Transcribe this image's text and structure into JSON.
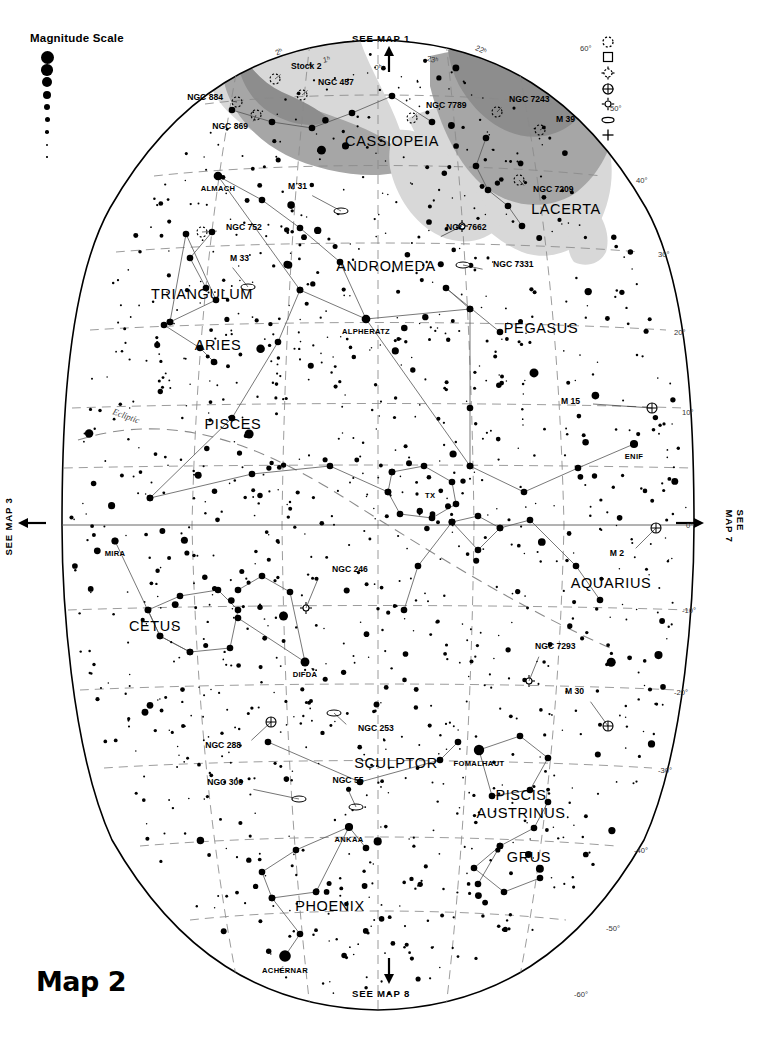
{
  "map": {
    "title": "Map 2",
    "navigation": {
      "top": "SEE MAP 1",
      "bottom": "SEE MAP 8",
      "left": "SEE MAP 3",
      "right": "SEE MAP 7"
    }
  },
  "magnitude_scale": {
    "title": "Magnitude Scale",
    "entries": [
      {
        "label": "-2",
        "size": 13
      },
      {
        "label": "-1",
        "size": 11.5
      },
      {
        "label": "0",
        "size": 10
      },
      {
        "label": "1",
        "size": 8.2
      },
      {
        "label": "2",
        "size": 6.4
      },
      {
        "label": "3",
        "size": 5.0
      },
      {
        "label": "4",
        "size": 3.6
      },
      {
        "label": "5",
        "size": 2.4
      },
      {
        "label": "6",
        "size": 1.6
      }
    ]
  },
  "object_legend": {
    "entries": [
      {
        "icon": "open-cluster-icon",
        "label": "Open Cluster"
      },
      {
        "icon": "bright-nebula-icon",
        "label": "Bright Nebula"
      },
      {
        "icon": "cluster-with-neb-icon",
        "label": "Cluster with Neb."
      },
      {
        "icon": "globular-cluster-icon",
        "label": "Globular Cluster"
      },
      {
        "icon": "planetary-nebula-icon",
        "label": "Planetary Nebula"
      },
      {
        "icon": "galaxy-icon",
        "label": "Galaxy"
      },
      {
        "icon": "extragalactic-object-icon",
        "label": "Object in other Galaxy"
      }
    ]
  },
  "chart_data": {
    "type": "scatter",
    "title": "Map 2",
    "projection": "elliptical sky chart",
    "ra_range_hours": [
      22,
      2
    ],
    "dec_range_deg": [
      -60,
      60
    ],
    "grid": true,
    "ra_ticks": [
      "2ʰ",
      "1ʰ",
      "0ʰ",
      "23ʰ",
      "22ʰ"
    ],
    "dec_ticks_right": [
      "60°",
      "50°",
      "40°",
      "30°",
      "20°",
      "10°",
      "0°",
      "-10°",
      "-20°",
      "-30°",
      "-40°",
      "-50°",
      "-60°"
    ],
    "ecliptic_label": "Ecliptic",
    "milky_way_shading": [
      "#d8d8d8",
      "#a6a6a6",
      "#8d8d8d"
    ],
    "constellations": [
      {
        "name": "CASSIOPEIA",
        "x": 392,
        "y": 146
      },
      {
        "name": "LACERTA",
        "x": 566,
        "y": 214
      },
      {
        "name": "ANDROMEDA",
        "x": 386,
        "y": 271
      },
      {
        "name": "TRIANGULUM",
        "x": 202,
        "y": 299
      },
      {
        "name": "ARIES",
        "x": 218,
        "y": 350
      },
      {
        "name": "PEGASUS",
        "x": 541,
        "y": 333
      },
      {
        "name": "PISCES",
        "x": 233,
        "y": 429
      },
      {
        "name": "AQUARIUS",
        "x": 611,
        "y": 588
      },
      {
        "name": "CETUS",
        "x": 155,
        "y": 631
      },
      {
        "name": "SCULPTOR",
        "x": 396,
        "y": 768
      },
      {
        "name": "PISCIS AUSTRINUS",
        "x": 521,
        "y": 800
      },
      {
        "name": "GRUS",
        "x": 529,
        "y": 862
      },
      {
        "name": "PHOENIX",
        "x": 330,
        "y": 911
      }
    ],
    "named_stars": [
      {
        "name": "ALMACH",
        "x": 218,
        "y": 176,
        "mag": 2.1
      },
      {
        "name": "ALPHERATZ",
        "x": 366,
        "y": 319,
        "mag": 2.1
      },
      {
        "name": "ENIF",
        "x": 634,
        "y": 444,
        "mag": 2.4
      },
      {
        "name": "MIRA",
        "x": 115,
        "y": 541,
        "mag": 3.0
      },
      {
        "name": "DIFDA",
        "x": 305,
        "y": 662,
        "mag": 2.0
      },
      {
        "name": "FOMALHAUT",
        "x": 479,
        "y": 750,
        "mag": 1.2
      },
      {
        "name": "ANKAA",
        "x": 349,
        "y": 827,
        "mag": 2.4
      },
      {
        "name": "ACHÉRNAR",
        "x": 285,
        "y": 956,
        "mag": 0.5
      },
      {
        "name": "TX",
        "x": 417,
        "y": 494,
        "mag": 5.0
      }
    ],
    "deep_sky_objects": [
      {
        "name": "Stock 2",
        "type": "open-cluster",
        "x": 275,
        "y": 79
      },
      {
        "name": "NGC 884",
        "type": "open-cluster",
        "x": 237,
        "y": 102
      },
      {
        "name": "NGC 869",
        "type": "open-cluster",
        "x": 256,
        "y": 115
      },
      {
        "name": "NGC 457",
        "type": "open-cluster",
        "x": 302,
        "y": 95
      },
      {
        "name": "NGC 7789",
        "type": "open-cluster",
        "x": 412,
        "y": 118
      },
      {
        "name": "NGC 7243",
        "type": "open-cluster",
        "x": 497,
        "y": 112
      },
      {
        "name": "M 39",
        "type": "open-cluster",
        "x": 540,
        "y": 130
      },
      {
        "name": "NGC 7209",
        "type": "open-cluster",
        "x": 519,
        "y": 180
      },
      {
        "name": "M 31",
        "type": "galaxy",
        "x": 315,
        "y": 201
      },
      {
        "name": "NGC 752",
        "type": "open-cluster",
        "x": 212,
        "y": 232
      },
      {
        "name": "NGC 7662",
        "type": "planetary-nebula",
        "x": 438,
        "y": 242
      },
      {
        "name": "M 33",
        "type": "galaxy",
        "x": 234,
        "y": 273
      },
      {
        "name": "NGC 7331",
        "type": "galaxy",
        "x": 477,
        "y": 271
      },
      {
        "name": "M 15",
        "type": "globular-cluster",
        "x": 600,
        "y": 404
      },
      {
        "name": "M 2",
        "type": "globular-cluster",
        "x": 642,
        "y": 542
      },
      {
        "name": "NGC 246",
        "type": "planetary-nebula",
        "x": 310,
        "y": 586
      },
      {
        "name": "NGC 7293",
        "type": "planetary-nebula",
        "x": 541,
        "y": 663
      },
      {
        "name": "M 30",
        "type": "globular-cluster",
        "x": 594,
        "y": 708
      },
      {
        "name": "NGC 253",
        "type": "galaxy",
        "x": 340,
        "y": 719
      },
      {
        "name": "NGC 288",
        "type": "globular-cluster",
        "x": 257,
        "y": 734
      },
      {
        "name": "NGC 300",
        "type": "galaxy",
        "x": 259,
        "y": 793
      },
      {
        "name": "NGC 55",
        "type": "galaxy",
        "x": 348,
        "y": 795
      }
    ]
  }
}
